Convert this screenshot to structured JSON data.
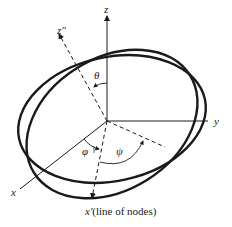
{
  "diagram": {
    "type": "euler-angles",
    "axes": {
      "z": "z",
      "y": "y",
      "x": "x",
      "z_double_prime": "z″",
      "x_prime": "x′",
      "x_prime_note": "(line of nodes)"
    },
    "angles": {
      "theta": "θ",
      "phi": "φ",
      "psi": "ψ"
    },
    "colors": {
      "stroke": "#1a1a1a",
      "background": "#ffffff"
    }
  }
}
